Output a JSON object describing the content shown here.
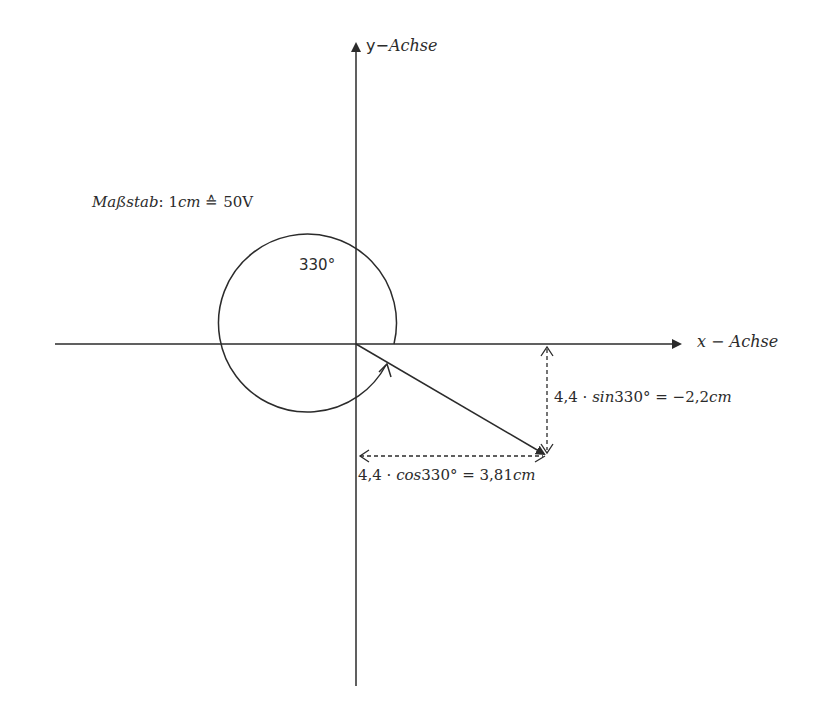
{
  "diagram": {
    "type": "phasor-diagram",
    "axes": {
      "x_label_var": "x",
      "x_label_dash": " − ",
      "x_label_word": "Achse",
      "y_label_var": "y",
      "y_label_dash": "−",
      "y_label_word": "Achse"
    },
    "scale": {
      "prefix": "Maßstab",
      "colon": ": ",
      "unit_value": "1",
      "unit": "cm",
      "corresponds": " ≙ ",
      "value": "50V"
    },
    "angle": {
      "label": "330°",
      "degrees": 330
    },
    "vector": {
      "length_cm": 4.4,
      "angle_deg": 330
    },
    "components": {
      "sin": {
        "factor": "4,4 · ",
        "func": "sin",
        "arg": "330° = −2,2",
        "unit": "cm"
      },
      "cos": {
        "factor": "4,4 · ",
        "func": "cos",
        "arg": "330° = 3,81",
        "unit": "cm"
      }
    },
    "colors": {
      "line": "#2b2b2b",
      "background": "#ffffff"
    }
  }
}
